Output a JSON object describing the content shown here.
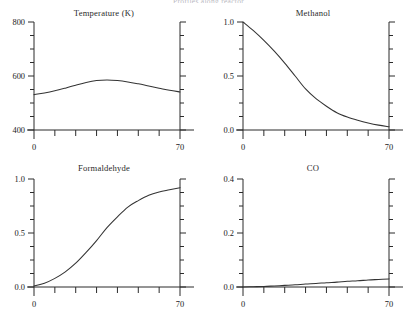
{
  "figure": {
    "suptitle": "Profiles along reactor",
    "xlabel_values": [
      "0",
      "70"
    ],
    "line_color": "#333333",
    "axis_color": "#2b2b2b"
  },
  "chart_data": [
    {
      "type": "line",
      "title": "Temperature (K)",
      "xlabel": "",
      "ylabel": "",
      "xlim": [
        0,
        70
      ],
      "ylim": [
        400,
        800
      ],
      "xticks": [
        0,
        10,
        20,
        30,
        40,
        50,
        60,
        70
      ],
      "xticklabels": [
        "0",
        "",
        "",
        "",
        "",
        "",
        "",
        "70"
      ],
      "yticks": [
        400,
        450,
        500,
        550,
        600,
        650,
        700,
        750,
        800
      ],
      "yticklabels": [
        "400",
        "",
        "",
        "",
        "600",
        "",
        "",
        "",
        "800"
      ],
      "grid": false,
      "legend": "none",
      "x": [
        0,
        5,
        10,
        15,
        20,
        25,
        30,
        35,
        40,
        45,
        50,
        55,
        60,
        65,
        70
      ],
      "values": [
        531,
        537,
        545,
        555,
        566,
        576,
        583,
        585,
        583,
        578,
        571,
        563,
        555,
        547,
        541
      ]
    },
    {
      "type": "line",
      "title": "Methanol",
      "xlabel": "",
      "ylabel": "",
      "xlim": [
        0,
        70
      ],
      "ylim": [
        0.0,
        1.0
      ],
      "xticks": [
        0,
        10,
        20,
        30,
        40,
        50,
        60,
        70
      ],
      "xticklabels": [
        "0",
        "",
        "",
        "",
        "",
        "",
        "",
        "70"
      ],
      "yticks": [
        0.0,
        0.125,
        0.25,
        0.375,
        0.5,
        0.625,
        0.75,
        0.875,
        1.0
      ],
      "yticklabels": [
        "0.0",
        "",
        "",
        "",
        "0.5",
        "",
        "",
        "",
        "1.0"
      ],
      "grid": false,
      "legend": "none",
      "x": [
        0,
        5,
        10,
        15,
        20,
        25,
        30,
        35,
        40,
        45,
        50,
        55,
        60,
        65,
        70
      ],
      "values": [
        1.0,
        0.92,
        0.83,
        0.73,
        0.62,
        0.5,
        0.38,
        0.29,
        0.22,
        0.16,
        0.12,
        0.09,
        0.065,
        0.045,
        0.03
      ]
    },
    {
      "type": "line",
      "title": "Formaldehyde",
      "xlabel": "",
      "ylabel": "",
      "xlim": [
        0,
        70
      ],
      "ylim": [
        0.0,
        1.0
      ],
      "xticks": [
        0,
        10,
        20,
        30,
        40,
        50,
        60,
        70
      ],
      "xticklabels": [
        "0",
        "",
        "",
        "",
        "",
        "",
        "",
        "70"
      ],
      "yticks": [
        0.0,
        0.125,
        0.25,
        0.375,
        0.5,
        0.625,
        0.75,
        0.875,
        1.0
      ],
      "yticklabels": [
        "0.0",
        "",
        "",
        "",
        "0.5",
        "",
        "",
        "",
        "1.0"
      ],
      "grid": false,
      "legend": "none",
      "x": [
        0,
        5,
        10,
        15,
        20,
        25,
        30,
        35,
        40,
        45,
        50,
        55,
        60,
        65,
        70
      ],
      "values": [
        0.01,
        0.035,
        0.08,
        0.14,
        0.22,
        0.32,
        0.43,
        0.55,
        0.65,
        0.74,
        0.8,
        0.85,
        0.88,
        0.9,
        0.92
      ]
    },
    {
      "type": "line",
      "title": "CO",
      "xlabel": "",
      "ylabel": "",
      "xlim": [
        0,
        70
      ],
      "ylim": [
        0.0,
        0.4
      ],
      "xticks": [
        0,
        10,
        20,
        30,
        40,
        50,
        60,
        70
      ],
      "xticklabels": [
        "0",
        "",
        "",
        "",
        "",
        "",
        "",
        "70"
      ],
      "yticks": [
        0.0,
        0.05,
        0.1,
        0.15,
        0.2,
        0.25,
        0.3,
        0.35,
        0.4
      ],
      "yticklabels": [
        "0.0",
        "",
        "",
        "",
        "0.2",
        "",
        "",
        "",
        "0.4"
      ],
      "grid": false,
      "legend": "none",
      "x": [
        0,
        5,
        10,
        15,
        20,
        25,
        30,
        35,
        40,
        45,
        50,
        55,
        60,
        65,
        70
      ],
      "values": [
        0.0,
        0.001,
        0.002,
        0.004,
        0.006,
        0.008,
        0.011,
        0.013,
        0.016,
        0.018,
        0.021,
        0.023,
        0.026,
        0.028,
        0.03
      ]
    }
  ]
}
